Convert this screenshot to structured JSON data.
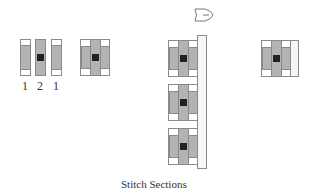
{
  "diagram": {
    "caption": "Stitch Sections",
    "column_labels": [
      "1",
      "2",
      "1"
    ],
    "icons": {
      "top": "shuttle-needle-icon"
    },
    "colors": {
      "strip": "#b3b3b3",
      "center": "#222222",
      "border": "#8a8a8a",
      "cap": "#ffffff"
    },
    "groups": [
      {
        "name": "separate-strips",
        "description": "three separate strips labelled 1 2 1"
      },
      {
        "name": "joined-block",
        "description": "three strips joined into one block"
      },
      {
        "name": "stacked-blocks-with-rail",
        "count": 3
      },
      {
        "name": "block-with-rail-strip"
      }
    ]
  }
}
